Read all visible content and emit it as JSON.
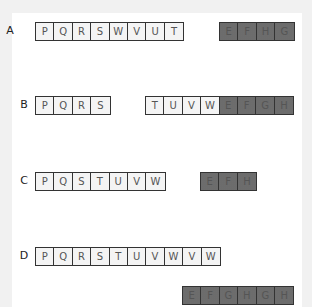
{
  "rows": [
    {
      "label": "A",
      "plain": [
        "P",
        "Q",
        "R",
        "S",
        "W",
        "V",
        "U",
        "T"
      ],
      "shaded": [
        "E",
        "F",
        "H",
        "G"
      ]
    },
    {
      "label": "B",
      "plain1": [
        "P",
        "Q",
        "R",
        "S"
      ],
      "plain2": [
        "T",
        "U",
        "V",
        "W"
      ],
      "shaded": [
        "E",
        "F",
        "G",
        "H"
      ]
    },
    {
      "label": "C",
      "plain": [
        "P",
        "Q",
        "S",
        "T",
        "U",
        "V",
        "W"
      ],
      "shaded": [
        "E",
        "F",
        "H"
      ]
    },
    {
      "label": "D",
      "plain": [
        "P",
        "Q",
        "R",
        "S",
        "T",
        "U",
        "V",
        "W",
        "V",
        "W"
      ],
      "shaded": [
        "E",
        "F",
        "G",
        "H",
        "G",
        "H"
      ]
    }
  ],
  "colors": {
    "shaded_fill": "#8a8a8a",
    "plain_fill": "#f4f4f4",
    "border": "#333333",
    "background": "#f1f1f1"
  }
}
